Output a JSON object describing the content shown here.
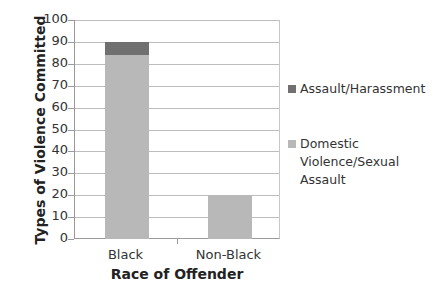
{
  "chart_data": {
    "type": "bar",
    "stacked": true,
    "title": "",
    "xlabel": "Race of Offender",
    "ylabel": "Types of Violence Committed",
    "categories": [
      "Black",
      "Non-Black"
    ],
    "series": [
      {
        "name": "Domestic Violence/Sexual Assault",
        "values": [
          84,
          20
        ],
        "color": "#b8b8b8"
      },
      {
        "name": "Assault/Harassment",
        "values": [
          6,
          0
        ],
        "color": "#707070"
      }
    ],
    "ylim": [
      0,
      100
    ],
    "yticks": [
      0,
      10,
      20,
      30,
      40,
      50,
      60,
      70,
      80,
      90,
      100
    ],
    "grid": true,
    "legend_position": "right"
  },
  "legend": {
    "items": [
      {
        "label": "Assault/Harassment",
        "color": "#707070"
      },
      {
        "label": "Domestic Violence/Sexual Assault",
        "color": "#b8b8b8"
      }
    ]
  }
}
